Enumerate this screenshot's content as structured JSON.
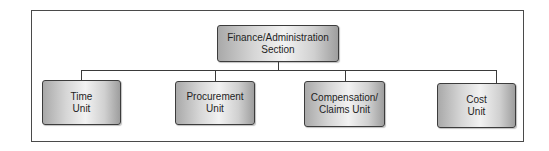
{
  "diagram": {
    "type": "org-chart",
    "root": {
      "label": "Finance/Administration\nSection"
    },
    "children": [
      {
        "label": "Time\nUnit"
      },
      {
        "label": "Procurement\nUnit"
      },
      {
        "label": "Compensation/\nClaims Unit"
      },
      {
        "label": "Cost\nUnit"
      }
    ],
    "colors": {
      "border": "#3c3c3c",
      "box_fill_dark": "#a9a9a9",
      "box_fill_light": "#f2f2f2",
      "connector": "#3a3a3a",
      "text": "#1e1e1e"
    }
  }
}
